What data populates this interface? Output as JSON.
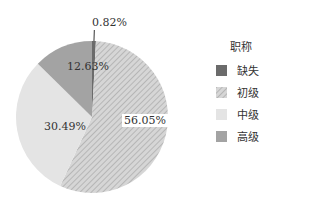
{
  "chart_data": {
    "type": "pie",
    "title": "",
    "legend_title": "职称",
    "legend_position": "right",
    "categories": [
      "缺失",
      "初级",
      "中级",
      "高级"
    ],
    "values": [
      0.82,
      56.05,
      30.49,
      12.63
    ],
    "labels": [
      "0.82%",
      "56.05%",
      "30.49%",
      "12.63%"
    ],
    "colors": [
      "#6b6b6b",
      "#c8c8c8",
      "#e4e4e4",
      "#a3a3a3"
    ],
    "patterns": [
      "solid",
      "diagonal-hatch",
      "solid",
      "solid"
    ],
    "start_angle": "12 o'clock, clockwise"
  },
  "legend": {
    "title": "职称",
    "items": [
      {
        "label": "缺失",
        "color": "#6b6b6b"
      },
      {
        "label": "初级",
        "color": "#c8c8c8"
      },
      {
        "label": "中级",
        "color": "#e4e4e4"
      },
      {
        "label": "高级",
        "color": "#a3a3a3"
      }
    ]
  }
}
